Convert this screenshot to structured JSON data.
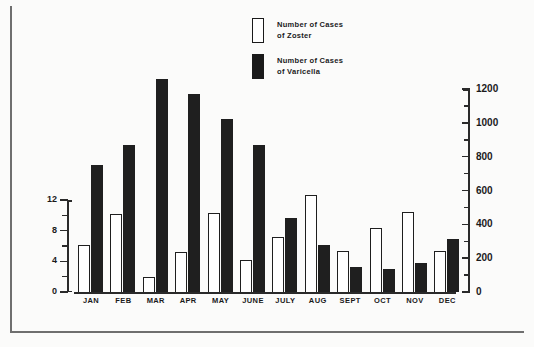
{
  "legend": {
    "items": [
      {
        "swatch": "open",
        "line1": "Number of Cases",
        "line2": "of Zoster"
      },
      {
        "swatch": "filled",
        "line1": "Number of Cases",
        "line2": "of Varicella"
      }
    ]
  },
  "axes": {
    "left": {
      "ticks": [
        "0",
        "4",
        "8",
        "12"
      ],
      "min": 0,
      "max": 12,
      "minor_step": 2
    },
    "right": {
      "ticks": [
        "0",
        "200",
        "400",
        "600",
        "800",
        "1000",
        "1200"
      ],
      "min": 0,
      "max": 1200,
      "minor_step": 100
    }
  },
  "colors": {
    "zoster": "#ffffff",
    "varicella": "#1f1f1f",
    "axis": "#2a2a2a",
    "frame": "#6f6f6f",
    "background": "#fbfbfa"
  },
  "chart_data": {
    "type": "bar",
    "title": "",
    "xlabel": "",
    "ylabel": "",
    "grid": false,
    "legend_position": "top-center",
    "categories": [
      "JAN",
      "FEB",
      "MAR",
      "APR",
      "MAY",
      "JUNE",
      "JULY",
      "AUG",
      "SEPT",
      "OCT",
      "NOV",
      "DEC"
    ],
    "series": [
      {
        "name": "Number of Cases of Zoster",
        "axis": "left",
        "ylim": [
          0,
          12
        ],
        "values": [
          6.1,
          10.2,
          1.9,
          5.2,
          10.3,
          4.2,
          7.2,
          12.6,
          5.4,
          8.3,
          10.4,
          5.4
        ]
      },
      {
        "name": "Number of Cases of Varicella",
        "axis": "right",
        "ylim": [
          0,
          1200
        ],
        "values": [
          750,
          870,
          1260,
          1170,
          1020,
          870,
          440,
          280,
          150,
          135,
          170,
          315
        ]
      }
    ]
  }
}
